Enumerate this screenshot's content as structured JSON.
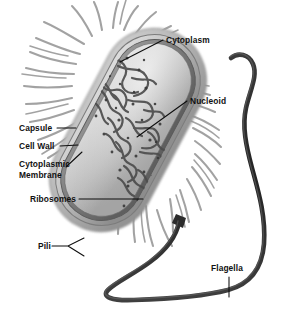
{
  "figure": {
    "background_color": "#ffffff",
    "width": 284,
    "height": 317,
    "style": "grayscale airbrush illustration"
  },
  "labels": {
    "cytoplasm": "Cytoplasm",
    "nucleoid": "Nucleoid",
    "capsule": "Capsule",
    "cell_wall": "Cell Wall",
    "cytoplasmic_membrane_line1": "Cytoplasmic",
    "cytoplasmic_membrane_line2": "Membrane",
    "ribosomes": "Ribosomes",
    "pili": "Pili",
    "flagella": "Flagella"
  },
  "colors": {
    "label_text": "#111111",
    "leader_line": "#0d0d0d",
    "capsule_outer": "#b9b9b9",
    "cell_wall": "#8f8f8f",
    "membrane": "#6e6e6e",
    "cytoplasm_light": "#d8d8d8",
    "cytoplasm_mid": "#b0b0b0",
    "nucleoid_dark": "#4a4a4a",
    "ribosome_speck": "#3a3a3a",
    "pili": "#9a9a9a",
    "flagella": "#2f2f2f",
    "background": "#ffffff"
  },
  "structures": [
    {
      "name": "capsule",
      "description": "outermost gelatinous layer surrounding the cell"
    },
    {
      "name": "cell-wall",
      "description": "rigid peptidoglycan layer beneath the capsule"
    },
    {
      "name": "cytoplasmic-membrane",
      "description": "innermost lipid bilayer enclosing the cytoplasm"
    },
    {
      "name": "cytoplasm",
      "description": "granular interior fluid of the cell"
    },
    {
      "name": "nucleoid",
      "description": "tangled mass of chromosomal DNA in the cell centre"
    },
    {
      "name": "ribosomes",
      "description": "dense dark specks scattered through the cytoplasm"
    },
    {
      "name": "pili",
      "description": "short hair-like appendages radiating from the cell surface"
    },
    {
      "name": "flagella",
      "description": "long whip-like appendage looping from the lower cell pole"
    }
  ]
}
